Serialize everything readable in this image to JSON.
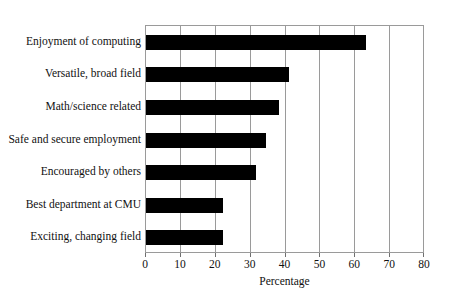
{
  "chart_data": {
    "type": "bar",
    "orientation": "horizontal",
    "title": "",
    "subtitle": "",
    "xlabel": "Percentage",
    "ylabel": "",
    "categories": [
      "Enjoyment of computing",
      "Versatile, broad field",
      "Math/science related",
      "Safe and secure employment",
      "Encouraged by others",
      "Best department at CMU",
      "Exciting, changing field"
    ],
    "values": [
      63,
      41,
      38,
      34.5,
      31.5,
      22,
      22
    ],
    "xlim": [
      0,
      80
    ],
    "xticks": [
      0,
      10,
      20,
      30,
      40,
      50,
      60,
      70,
      80
    ],
    "xtick_labels": [
      "0",
      "10",
      "20",
      "30",
      "40",
      "50",
      "60",
      "70",
      "80"
    ],
    "grid": "vertical",
    "legend": "none",
    "bar_color": "#000000",
    "grid_color": "#9a9a9a",
    "background_color": "#ffffff"
  }
}
